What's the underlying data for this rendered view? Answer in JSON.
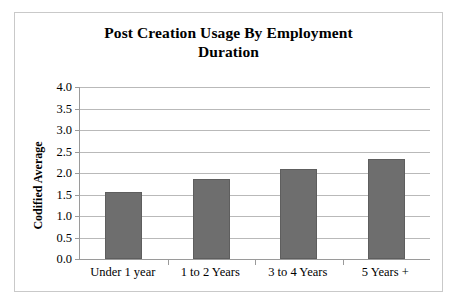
{
  "chart_data": {
    "type": "bar",
    "title": "Post Creation Usage By Employment Duration",
    "title_lines": [
      "Post Creation Usage By Employment",
      "Duration"
    ],
    "xlabel": "",
    "ylabel": "Codified Average",
    "categories": [
      "Under 1 year",
      "1 to 2 Years",
      "3 to 4 Years",
      "5 Years +"
    ],
    "values": [
      1.57,
      1.86,
      2.1,
      2.33
    ],
    "ylim": [
      0.0,
      4.0
    ],
    "ytick_step": 0.5,
    "ytick_labels": [
      "0.0",
      "0.5",
      "1.0",
      "1.5",
      "2.0",
      "2.5",
      "3.0",
      "3.5",
      "4.0"
    ],
    "ytick_values": [
      0.0,
      0.5,
      1.0,
      1.5,
      2.0,
      2.5,
      3.0,
      3.5,
      4.0
    ],
    "grid": true,
    "grid_axis": "y",
    "legend": false,
    "bar_color": "#6e6e6e",
    "grid_color": "#b9b9b9",
    "axis_color": "#9a9a9a",
    "frame_color": "#c9c9c9",
    "text_color": "#000000"
  }
}
